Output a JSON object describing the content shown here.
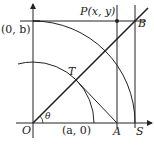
{
  "diagram": {
    "type": "geometry-construction",
    "labels": {
      "origin": "O",
      "theta": "θ",
      "point_b_axis": "(0, b)",
      "point_a_axis": "(a, 0)",
      "point_P": "P(x, y)",
      "point_B": "B",
      "point_T": "T",
      "point_A": "A",
      "point_S": "S"
    },
    "elements": [
      "x-axis with arrow",
      "y-axis with arrow",
      "circle arc radius a centered at O",
      "circle arc radius b centered at O",
      "ray from O through T to B at angle theta",
      "horizontal line y = b",
      "vertical line through P to A",
      "vertical line through B to S",
      "segment T to A"
    ],
    "colors": {
      "stroke": "#222222",
      "background": "#ffffff"
    }
  }
}
